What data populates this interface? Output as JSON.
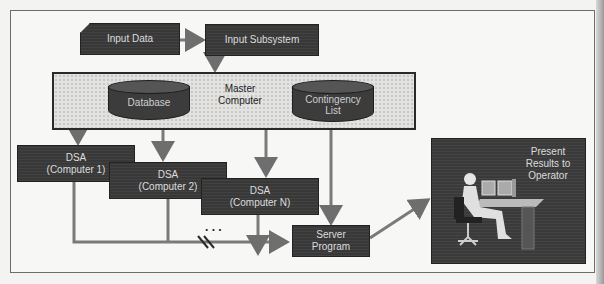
{
  "diagram": {
    "nodes": {
      "input_data": "Input Data",
      "input_subsystem": "Input Subsystem",
      "master_computer": {
        "line1": "Master",
        "line2": "Computer"
      },
      "database": "Database",
      "contingency_list": {
        "line1": "Contingency",
        "line2": "List"
      },
      "dsa1": {
        "line1": "DSA",
        "line2": "(Computer 1)"
      },
      "dsa2": {
        "line1": "DSA",
        "line2": "(Computer 2)"
      },
      "dsaN": {
        "line1": "DSA",
        "line2": "(Computer N)"
      },
      "server_program": {
        "line1": "Server",
        "line2": "Program"
      },
      "operator": {
        "line1": "Present",
        "line2": "Results to",
        "line3": "Operator"
      }
    },
    "ellipsis": ". . .",
    "edges": [
      {
        "from": "Input Data",
        "to": "Input Subsystem"
      },
      {
        "from": "Input Subsystem",
        "to": "Master Computer"
      },
      {
        "from": "Master Computer",
        "to": "DSA (Computer 1)"
      },
      {
        "from": "Master Computer",
        "to": "DSA (Computer 2)"
      },
      {
        "from": "Master Computer",
        "to": "DSA (Computer N)"
      },
      {
        "from": "Contingency List",
        "to": "Server Program"
      },
      {
        "from": "DSA (Computer 1)",
        "to": "Server Program"
      },
      {
        "from": "DSA (Computer 2)",
        "to": "Server Program"
      },
      {
        "from": "DSA (Computer N)",
        "to": "Server Program"
      },
      {
        "from": "Server Program",
        "to": "Present Results to Operator"
      }
    ],
    "colors": {
      "box": "#383838",
      "arrow": "#6e6e6e",
      "background": "#f7f7f5"
    }
  }
}
